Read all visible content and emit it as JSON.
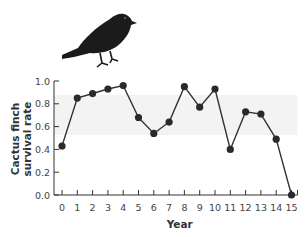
{
  "chart_data": {
    "type": "line",
    "title": "",
    "xlabel": "Year",
    "ylabel": "Cactus finch survival rate",
    "ylabel_lines": [
      "Cactus finch",
      "survival rate"
    ],
    "x": [
      0,
      1,
      2,
      3,
      4,
      5,
      6,
      7,
      8,
      9,
      10,
      11,
      12,
      13,
      14,
      15
    ],
    "categories": [
      "0",
      "1",
      "2",
      "3",
      "4",
      "5",
      "6",
      "7",
      "8",
      "9",
      "10",
      "11",
      "12",
      "13",
      "14",
      "15"
    ],
    "series": [
      {
        "name": "Cactus finch survival rate",
        "values": [
          0.43,
          0.85,
          0.89,
          0.93,
          0.96,
          0.68,
          0.54,
          0.64,
          0.95,
          0.77,
          0.93,
          0.4,
          0.73,
          0.71,
          0.49,
          0.0
        ]
      }
    ],
    "ylim": [
      0.0,
      1.0
    ],
    "yticks": [
      "0.0",
      "0.2",
      "0.4",
      "0.6",
      "0.8",
      "1.0"
    ],
    "grid": false,
    "legend": null,
    "marker": "filled-circle",
    "line_color": "#333333",
    "marker_color": "#2a2a2a",
    "illustration": "finch-bird-icon"
  }
}
